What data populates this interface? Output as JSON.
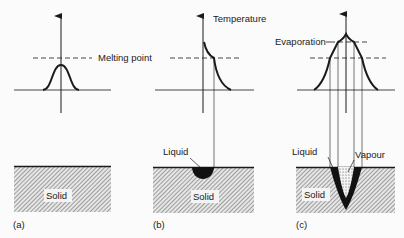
{
  "figure": {
    "colors": {
      "ink": "#1a1a1a",
      "background": "#fbfbfb",
      "hatch": "#555555"
    },
    "panels": [
      {
        "id": "a",
        "caption": "(a)",
        "solid_label": "Solid",
        "curve_label": "Melting point"
      },
      {
        "id": "b",
        "caption": "(b)",
        "solid_label": "Solid",
        "axis_label": "Temperature",
        "pool_label": "Liquid"
      },
      {
        "id": "c",
        "caption": "(c)",
        "solid_label": "Solid",
        "curve_label": "Evaporation",
        "pool_label": "Liquid",
        "vapour_label": "Vapour"
      }
    ]
  }
}
